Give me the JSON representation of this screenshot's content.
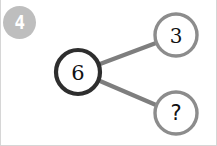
{
  "canvas": {
    "width": 217,
    "height": 146,
    "background": "#ffffff"
  },
  "badge": {
    "label": "4",
    "fill": "#b9b9b9",
    "text_color": "#ffffff"
  },
  "diagram": {
    "type": "node-link",
    "colors": {
      "root_stroke": "#2e2e2e",
      "leaf_stroke": "#8c8c8c",
      "edge_stroke": "#7e7e7e",
      "node_fill": "#ffffff",
      "label_color": "#111111"
    },
    "nodes": [
      {
        "id": "root",
        "label": "6",
        "cx": 77,
        "cy": 72,
        "r": 22,
        "role": "root",
        "emphasis": "bold"
      },
      {
        "id": "child-top",
        "label": "3",
        "cx": 175,
        "cy": 35,
        "r": 21,
        "role": "leaf",
        "emphasis": "normal"
      },
      {
        "id": "child-bottom",
        "label": "?",
        "cx": 175,
        "cy": 113,
        "r": 21,
        "role": "leaf",
        "emphasis": "normal"
      }
    ],
    "edges": [
      {
        "id": "edge-root-top",
        "from": "root",
        "to": "child-top",
        "x1": 99,
        "y1": 64,
        "x2": 155,
        "y2": 43
      },
      {
        "id": "edge-root-bottom",
        "from": "root",
        "to": "child-bottom",
        "x1": 99,
        "y1": 81,
        "x2": 155,
        "y2": 105
      }
    ]
  }
}
